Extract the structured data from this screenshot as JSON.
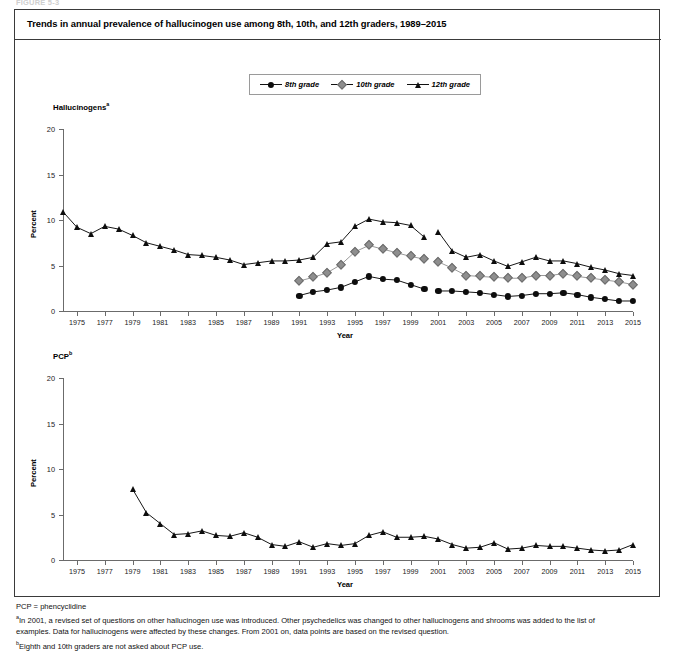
{
  "figure_tag": "FIGURE 5-3",
  "title": "Trends in annual prevalence of hallucinogen use among 8th, 10th, and 12th graders, 1989–2015",
  "legend": {
    "items": [
      {
        "label": "8th grade",
        "marker": "circle",
        "color": "#0d0d0d"
      },
      {
        "label": "10th grade",
        "marker": "diamond",
        "color": "#8e8e8e"
      },
      {
        "label": "12th grade",
        "marker": "triangle",
        "color": "#0d0d0d"
      }
    ]
  },
  "axis": {
    "ylabel": "Percent",
    "xlabel": "Year",
    "yticks": [
      0,
      5,
      10,
      15,
      20
    ],
    "ylim": [
      0,
      20
    ],
    "xlim": [
      1974,
      2015
    ],
    "xticks": [
      1975,
      1977,
      1979,
      1981,
      1983,
      1985,
      1987,
      1989,
      1991,
      1993,
      1995,
      1997,
      1999,
      2001,
      2003,
      2005,
      2007,
      2009,
      2011,
      2013,
      2015
    ]
  },
  "footnotes": {
    "abbrev": "PCP = phencyclidine",
    "a": "In 2001, a revised set of questions on other hallucinogen use was introduced. Other psychedelics was changed to other hallucinogens and shrooms was added to the list of examples. Data for hallucinogens were affected by these changes. From 2001 on, data points are based on the revised question.",
    "b": "Eighth and 10th graders are not asked about PCP use."
  },
  "chart_data": [
    {
      "type": "line",
      "panel_id": "hallucinogens",
      "title": "Hallucinogens",
      "title_superscript": "a",
      "xlabel": "Year",
      "ylabel": "Percent",
      "ylim": [
        0,
        20
      ],
      "xlim": [
        1974,
        2015
      ],
      "grid": false,
      "legend_position": "top-center",
      "series": [
        {
          "name": "8th grade",
          "marker": "circle",
          "color": "#0d0d0d",
          "segments": [
            {
              "x": [
                1991,
                1992,
                1993,
                1994,
                1995,
                1996,
                1997,
                1998,
                1999,
                2000
              ],
              "y": [
                1.7,
                2.1,
                2.3,
                2.6,
                3.2,
                3.8,
                3.5,
                3.4,
                2.9,
                2.4
              ]
            },
            {
              "x": [
                2001,
                2002,
                2003,
                2004,
                2005,
                2006,
                2007,
                2008,
                2009,
                2010,
                2011,
                2012,
                2013,
                2014,
                2015
              ],
              "y": [
                2.2,
                2.2,
                2.1,
                2.0,
                1.8,
                1.6,
                1.7,
                1.9,
                1.9,
                2.0,
                1.8,
                1.5,
                1.3,
                1.1,
                1.1
              ]
            }
          ]
        },
        {
          "name": "10th grade",
          "marker": "diamond",
          "color": "#8e8e8e",
          "segments": [
            {
              "x": [
                1991,
                1992,
                1993,
                1994,
                1995,
                1996,
                1997,
                1998,
                1999,
                2000
              ],
              "y": [
                3.3,
                3.7,
                4.2,
                5.1,
                6.5,
                7.2,
                6.8,
                6.4,
                6.0,
                5.7
              ]
            },
            {
              "x": [
                2001,
                2002,
                2003,
                2004,
                2005,
                2006,
                2007,
                2008,
                2009,
                2010,
                2011,
                2012,
                2013,
                2014,
                2015
              ],
              "y": [
                5.4,
                4.7,
                3.9,
                3.8,
                3.7,
                3.6,
                3.6,
                3.9,
                3.9,
                4.1,
                3.8,
                3.6,
                3.4,
                3.2,
                2.9
              ]
            }
          ]
        },
        {
          "name": "12th grade",
          "marker": "triangle",
          "color": "#0d0d0d",
          "segments": [
            {
              "x": [
                1974,
                1975,
                1976,
                1977,
                1978,
                1979,
                1980,
                1981,
                1982,
                1983,
                1984,
                1985,
                1986,
                1987,
                1988,
                1989,
                1990,
                1991,
                1992,
                1993,
                1994,
                1995,
                1996,
                1997,
                1998,
                1999,
                2000
              ],
              "y": [
                10.9,
                9.2,
                8.5,
                9.3,
                9.0,
                8.3,
                7.5,
                7.1,
                6.7,
                6.2,
                6.1,
                5.9,
                5.6,
                5.1,
                5.3,
                5.5,
                5.5,
                5.6,
                5.9,
                7.4,
                7.6,
                9.3,
                10.1,
                9.8,
                9.7,
                9.4,
                8.1
              ]
            },
            {
              "x": [
                2001,
                2002,
                2003,
                2004,
                2005,
                2006,
                2007,
                2008,
                2009,
                2010,
                2011,
                2012,
                2013,
                2014,
                2015
              ],
              "y": [
                8.7,
                6.6,
                5.9,
                6.2,
                5.5,
                4.9,
                5.4,
                5.9,
                5.5,
                5.5,
                5.2,
                4.8,
                4.5,
                4.1,
                3.9
              ]
            }
          ]
        }
      ]
    },
    {
      "type": "line",
      "panel_id": "pcp",
      "title": "PCP",
      "title_superscript": "b",
      "xlabel": "Year",
      "ylabel": "Percent",
      "ylim": [
        0,
        20
      ],
      "xlim": [
        1974,
        2015
      ],
      "grid": false,
      "series": [
        {
          "name": "12th grade",
          "marker": "triangle",
          "color": "#0d0d0d",
          "segments": [
            {
              "x": [
                1979,
                1980,
                1981,
                1982,
                1983,
                1984,
                1985,
                1986,
                1987,
                1988,
                1989,
                1990,
                1991,
                1992,
                1993,
                1994,
                1995,
                1996,
                1997,
                1998,
                1999,
                2000,
                2001,
                2002,
                2003,
                2004,
                2005,
                2006,
                2007,
                2008,
                2009,
                2010,
                2011,
                2012,
                2013,
                2014,
                2015
              ],
              "y": [
                7.8,
                5.2,
                4.0,
                2.8,
                2.9,
                3.2,
                2.7,
                2.6,
                3.0,
                2.5,
                1.7,
                1.5,
                2.0,
                1.4,
                1.8,
                1.6,
                1.8,
                2.7,
                3.1,
                2.5,
                2.5,
                2.6,
                2.3,
                1.7,
                1.3,
                1.4,
                1.9,
                1.2,
                1.3,
                1.6,
                1.5,
                1.5,
                1.3,
                1.1,
                1.0,
                1.1,
                1.7
              ]
            }
          ]
        }
      ]
    }
  ]
}
